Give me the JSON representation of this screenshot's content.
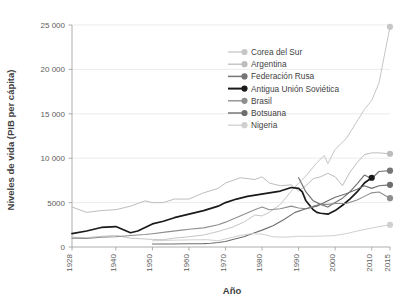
{
  "chart_data": {
    "type": "line",
    "title": "",
    "xlabel": "Año",
    "ylabel": "Niveles de vida (PIB per cápita)",
    "xlim": [
      1928,
      2015
    ],
    "ylim": [
      0,
      25000
    ],
    "grid": true,
    "legend_position": "top-center-inside",
    "x_ticks": [
      "1928",
      "1940",
      "1950",
      "1960",
      "1970",
      "1980",
      "1990",
      "2000",
      "2010",
      "2015"
    ],
    "x_tick_values": [
      1928,
      1940,
      1950,
      1960,
      1970,
      1980,
      1990,
      2000,
      2010,
      2015
    ],
    "y_ticks": [
      "0",
      "5000",
      "10 000",
      "15 000",
      "20 000",
      "25 000"
    ],
    "y_tick_values": [
      0,
      5000,
      10000,
      15000,
      20000,
      25000
    ],
    "series": [
      {
        "name": "Corea del Sur",
        "color": "#c6c6c6",
        "width": 1.0,
        "endpoint_marker": true,
        "x": [
          1928,
          1932,
          1936,
          1940,
          1944,
          1948,
          1950,
          1953,
          1956,
          1960,
          1964,
          1968,
          1970,
          1972,
          1975,
          1978,
          1980,
          1982,
          1985,
          1988,
          1990,
          1992,
          1995,
          1997,
          1998,
          2000,
          2003,
          2005,
          2008,
          2010,
          2012,
          2015
        ],
        "y": [
          1100,
          1050,
          1200,
          1300,
          1000,
          900,
          850,
          820,
          1000,
          1150,
          1350,
          1750,
          2000,
          2250,
          2800,
          3600,
          3500,
          3900,
          4800,
          6300,
          7200,
          8000,
          9500,
          10300,
          9400,
          11000,
          12200,
          13500,
          15500,
          16500,
          18500,
          24800
        ]
      },
      {
        "name": "Argentina",
        "color": "#bdbdbd",
        "width": 1.0,
        "endpoint_marker": true,
        "x": [
          1928,
          1932,
          1936,
          1940,
          1944,
          1948,
          1950,
          1953,
          1956,
          1960,
          1964,
          1968,
          1970,
          1974,
          1978,
          1980,
          1982,
          1985,
          1988,
          1990,
          1992,
          1994,
          1996,
          1998,
          2000,
          2002,
          2004,
          2006,
          2008,
          2010,
          2012,
          2015
        ],
        "y": [
          4500,
          3900,
          4100,
          4200,
          4600,
          5200,
          5000,
          5000,
          5400,
          5400,
          6100,
          6600,
          7200,
          7800,
          7600,
          7900,
          7200,
          6900,
          7000,
          6300,
          6900,
          7700,
          7900,
          8300,
          7900,
          6900,
          8400,
          9500,
          10400,
          10600,
          10600,
          10500
        ]
      },
      {
        "name": "Federación Rusa",
        "color": "#757575",
        "width": 1.2,
        "endpoint_marker": true,
        "x": [
          1990,
          1992,
          1994,
          1996,
          1998,
          2000,
          2002,
          2004,
          2006,
          2008,
          2010,
          2012,
          2015
        ],
        "y": [
          7800,
          6200,
          5200,
          4800,
          4500,
          5000,
          5500,
          6200,
          7100,
          8100,
          7700,
          8500,
          8600
        ]
      },
      {
        "name": "Antigua Unión Soviética",
        "color": "#1a1a1a",
        "width": 1.7,
        "endpoint_marker": true,
        "x": [
          1928,
          1932,
          1936,
          1940,
          1944,
          1946,
          1948,
          1950,
          1953,
          1956,
          1960,
          1964,
          1968,
          1970,
          1973,
          1976,
          1979,
          1982,
          1985,
          1988,
          1990,
          1991,
          1992,
          1994,
          1995,
          1996,
          1998,
          2000,
          2002,
          2004,
          2006,
          2008,
          2010
        ],
        "y": [
          1500,
          1800,
          2200,
          2300,
          1600,
          1800,
          2200,
          2600,
          2900,
          3300,
          3700,
          4100,
          4600,
          5000,
          5400,
          5700,
          5900,
          6100,
          6300,
          6700,
          6600,
          6200,
          5200,
          4200,
          3900,
          3800,
          3700,
          4100,
          4700,
          5400,
          6200,
          7200,
          7800
        ]
      },
      {
        "name": "Brasil",
        "color": "#8e8e8e",
        "width": 1.1,
        "endpoint_marker": true,
        "x": [
          1928,
          1932,
          1936,
          1940,
          1944,
          1948,
          1950,
          1954,
          1958,
          1960,
          1964,
          1968,
          1970,
          1974,
          1978,
          1980,
          1982,
          1985,
          1988,
          1990,
          1992,
          1994,
          1996,
          1998,
          2000,
          2003,
          2006,
          2008,
          2010,
          2012,
          2015
        ],
        "y": [
          1000,
          950,
          1100,
          1150,
          1300,
          1400,
          1500,
          1700,
          1900,
          2000,
          2150,
          2500,
          2800,
          3500,
          4200,
          4500,
          4200,
          4300,
          4600,
          4400,
          4300,
          4600,
          4800,
          4800,
          4900,
          4900,
          5300,
          5700,
          6100,
          6200,
          5500
        ]
      },
      {
        "name": "Botsuana",
        "color": "#6e6e6e",
        "width": 1.1,
        "endpoint_marker": true,
        "x": [
          1950,
          1955,
          1960,
          1964,
          1966,
          1968,
          1970,
          1972,
          1975,
          1978,
          1980,
          1983,
          1986,
          1989,
          1992,
          1995,
          1998,
          2000,
          2003,
          2006,
          2008,
          2010,
          2012,
          2015
        ],
        "y": [
          330,
          340,
          360,
          380,
          420,
          500,
          620,
          850,
          1150,
          1600,
          1900,
          2400,
          3100,
          3900,
          4300,
          4600,
          5200,
          5600,
          6000,
          6500,
          6900,
          6600,
          6900,
          7000
        ]
      },
      {
        "name": "Nigeria",
        "color": "#d0d0d0",
        "width": 1.0,
        "endpoint_marker": true,
        "x": [
          1950,
          1955,
          1960,
          1965,
          1968,
          1970,
          1974,
          1977,
          1980,
          1983,
          1986,
          1990,
          1994,
          1998,
          2000,
          2003,
          2006,
          2009,
          2012,
          2015
        ],
        "y": [
          700,
          760,
          800,
          820,
          700,
          900,
          1300,
          1500,
          1450,
          1150,
          1100,
          1200,
          1200,
          1250,
          1300,
          1500,
          1800,
          2050,
          2300,
          2500
        ]
      }
    ]
  },
  "legend": {
    "items": [
      {
        "label": "Corea del Sur"
      },
      {
        "label": "Argentina"
      },
      {
        "label": "Federación Rusa"
      },
      {
        "label": "Antigua Unión Soviética"
      },
      {
        "label": "Brasil"
      },
      {
        "label": "Botsuana"
      },
      {
        "label": "Nigeria"
      }
    ]
  }
}
